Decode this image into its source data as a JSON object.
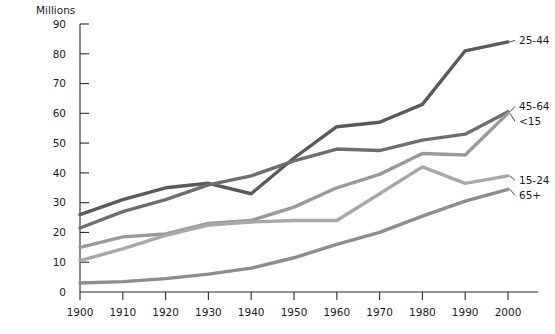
{
  "chart_data": {
    "type": "line",
    "title": "",
    "subtitle": "",
    "ylabel": "Millions",
    "xlabel": "",
    "grid": false,
    "legend_position": "right-inline-labels",
    "categories": [
      1900,
      1910,
      1920,
      1930,
      1940,
      1950,
      1960,
      1970,
      1980,
      1990,
      2000
    ],
    "x": [
      1900,
      1910,
      1920,
      1930,
      1940,
      1950,
      1960,
      1970,
      1980,
      1990,
      2000
    ],
    "xlim": [
      1900,
      2000
    ],
    "ylim": [
      0,
      90
    ],
    "ytick_values": [
      0,
      10,
      20,
      30,
      40,
      50,
      60,
      70,
      80,
      90
    ],
    "ytick_labels": [
      "0",
      "10",
      "20",
      "30",
      "40",
      "50",
      "60",
      "70",
      "80",
      "90"
    ],
    "xtick_labels": [
      "1900",
      "1910",
      "1920",
      "1930",
      "1940",
      "1950",
      "1960",
      "1970",
      "1980",
      "1990",
      "2000"
    ],
    "series": [
      {
        "name": "25-44",
        "label": "25-44",
        "color": "#5a5a5a",
        "values": [
          26,
          31,
          35,
          36.5,
          33,
          45,
          55.5,
          57,
          63,
          81,
          84
        ]
      },
      {
        "name": "45-64",
        "label": "45-64",
        "color": "#6e6e6e",
        "values": [
          21.5,
          27,
          31,
          36,
          39,
          44,
          48,
          47.5,
          51,
          53,
          60.5
        ]
      },
      {
        "name": "<15",
        "label": "<15",
        "color": "#9a9a9a",
        "values": [
          15,
          18.5,
          19.5,
          23,
          24,
          28.5,
          35,
          39.5,
          46.5,
          46,
          60
        ]
      },
      {
        "name": "15-24",
        "label": "15-24",
        "color": "#a8a8a8",
        "values": [
          10.5,
          14.5,
          19,
          22.5,
          23.5,
          24,
          24,
          33,
          42,
          36.5,
          39
        ]
      },
      {
        "name": "65+",
        "label": "65+",
        "color": "#8d8d8d",
        "values": [
          3,
          3.5,
          4.5,
          6,
          8,
          11.5,
          16,
          20,
          25.5,
          30.5,
          34.5
        ]
      }
    ]
  },
  "axis": {
    "y_title": "Millions"
  }
}
